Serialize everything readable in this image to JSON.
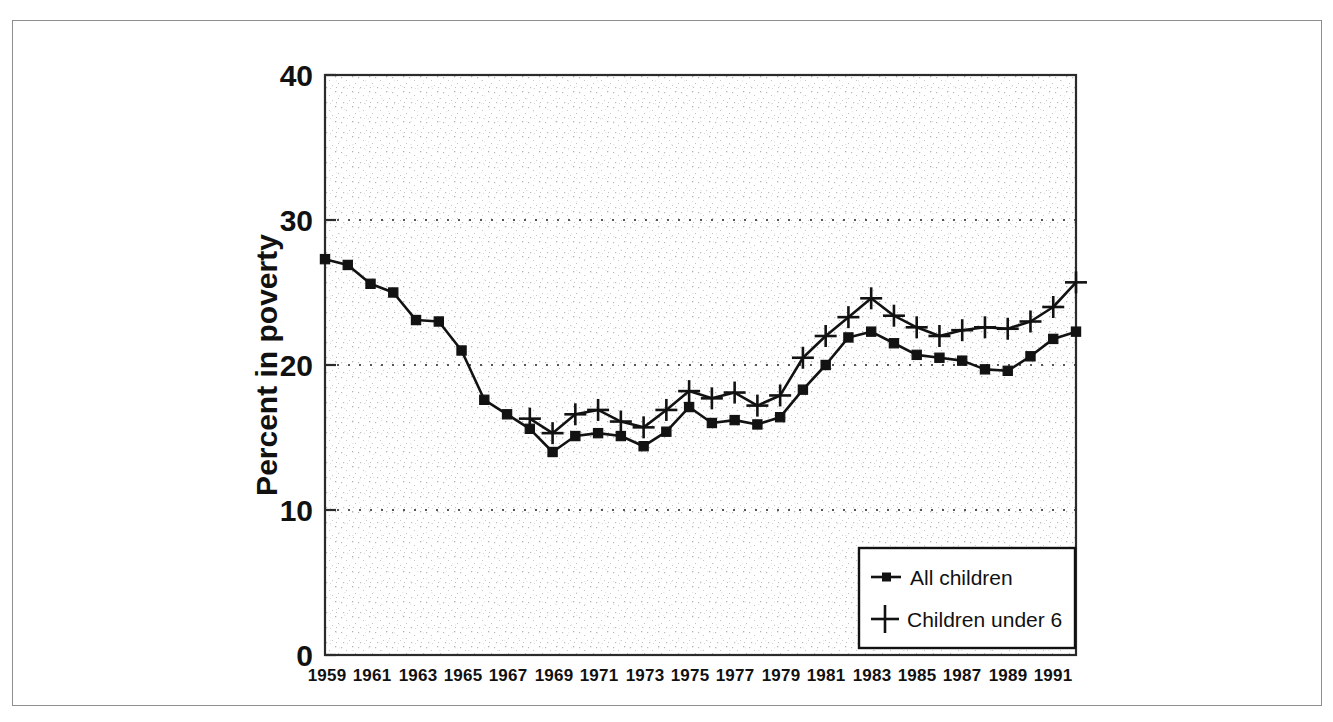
{
  "figure": {
    "background_color": "#ffffff",
    "border_color": "#8e8e8e",
    "ink_color": "#121212"
  },
  "chart_data": {
    "type": "line",
    "title": "",
    "subtitle": "",
    "xlabel": "",
    "ylabel": "Percent in poverty",
    "xlim": [
      1959,
      1992
    ],
    "ylim": [
      0,
      40
    ],
    "yticks": [
      0,
      10,
      20,
      30,
      40
    ],
    "ytick_labels": [
      "0",
      "10",
      "20",
      "30",
      "40"
    ],
    "xticks": [
      1959,
      1961,
      1963,
      1965,
      1967,
      1969,
      1971,
      1973,
      1975,
      1977,
      1979,
      1981,
      1983,
      1985,
      1987,
      1989,
      1991
    ],
    "xtick_labels": [
      "1959",
      "1961",
      "1963",
      "1965",
      "1967",
      "1969",
      "1971",
      "1973",
      "1975",
      "1977",
      "1979",
      "1981",
      "1983",
      "1985",
      "1987",
      "1989",
      "1991"
    ],
    "grid": "horizontal-dotted",
    "gridlines_at": [
      10,
      20,
      30
    ],
    "legend_position": "bottom-right",
    "x": [
      1959,
      1960,
      1961,
      1962,
      1963,
      1964,
      1965,
      1966,
      1967,
      1968,
      1969,
      1970,
      1971,
      1972,
      1973,
      1974,
      1975,
      1976,
      1977,
      1978,
      1979,
      1980,
      1981,
      1982,
      1983,
      1984,
      1985,
      1986,
      1987,
      1988,
      1989,
      1990,
      1991,
      1992
    ],
    "series": [
      {
        "name": "All children",
        "marker": "square",
        "x": [
          1959,
          1960,
          1961,
          1962,
          1963,
          1964,
          1965,
          1966,
          1967,
          1968,
          1969,
          1970,
          1971,
          1972,
          1973,
          1974,
          1975,
          1976,
          1977,
          1978,
          1979,
          1980,
          1981,
          1982,
          1983,
          1984,
          1985,
          1986,
          1987,
          1988,
          1989,
          1990,
          1991,
          1992
        ],
        "values": [
          27.3,
          26.9,
          25.6,
          25.0,
          23.1,
          23.0,
          21.0,
          17.6,
          16.6,
          15.6,
          14.0,
          15.1,
          15.3,
          15.1,
          14.4,
          15.4,
          17.1,
          16.0,
          16.2,
          15.9,
          16.4,
          18.3,
          20.0,
          21.9,
          22.3,
          21.5,
          20.7,
          20.5,
          20.3,
          19.7,
          19.6,
          20.6,
          21.8,
          22.3
        ]
      },
      {
        "name": "Children under 6",
        "marker": "plus",
        "x": [
          1968,
          1969,
          1970,
          1971,
          1972,
          1973,
          1974,
          1975,
          1976,
          1977,
          1978,
          1979,
          1980,
          1981,
          1982,
          1983,
          1984,
          1985,
          1986,
          1987,
          1988,
          1989,
          1990,
          1991,
          1992
        ],
        "values": [
          16.3,
          15.3,
          16.6,
          16.9,
          16.1,
          15.7,
          16.9,
          18.2,
          17.7,
          18.1,
          17.2,
          17.9,
          20.5,
          22.0,
          23.3,
          24.6,
          23.4,
          22.6,
          22.0,
          22.4,
          22.6,
          22.5,
          23.0,
          24.0,
          25.7
        ]
      }
    ],
    "legend": [
      {
        "label": "All children",
        "marker": "square-with-line"
      },
      {
        "label": "Children under 6",
        "marker": "plus"
      }
    ]
  }
}
